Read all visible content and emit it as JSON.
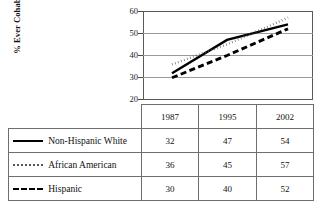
{
  "chart_data": {
    "type": "line",
    "title": "",
    "xlabel": "",
    "ylabel": "% Ever Cohabited",
    "categories": [
      "1987",
      "1995",
      "2002"
    ],
    "x": [
      1987,
      1995,
      2002
    ],
    "ylim": [
      20,
      60
    ],
    "yticks": [
      20,
      30,
      40,
      50,
      60
    ],
    "ytick_labels": [
      "20",
      "30",
      "40",
      "50",
      "60"
    ],
    "grid": "horizontal",
    "legend_position": "table-below",
    "series": [
      {
        "name": "Non-Hispanic White",
        "values": [
          32,
          47,
          54
        ],
        "style": "solid",
        "color": "#000000",
        "swatch": "line-solid-icon"
      },
      {
        "name": "African American",
        "values": [
          36,
          45,
          57
        ],
        "style": "dotted",
        "color": "#555555",
        "swatch": "line-dotted-icon"
      },
      {
        "name": "Hispanic",
        "values": [
          30,
          40,
          52
        ],
        "style": "dashed",
        "color": "#000000",
        "swatch": "line-dashed-icon"
      }
    ]
  },
  "table": {
    "corner_label": "",
    "column_headers": [
      "1987",
      "1995",
      "2002"
    ],
    "rows": [
      {
        "label": "Non-Hispanic White",
        "cells": [
          "32",
          "47",
          "54"
        ]
      },
      {
        "label": "African American",
        "cells": [
          "36",
          "45",
          "57"
        ]
      },
      {
        "label": "Hispanic",
        "cells": [
          "30",
          "40",
          "52"
        ]
      }
    ]
  },
  "axis": {
    "tick_60": "60",
    "tick_50": "50",
    "tick_40": "40",
    "tick_30": "30",
    "tick_20": "20"
  }
}
